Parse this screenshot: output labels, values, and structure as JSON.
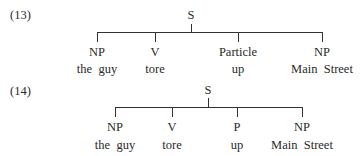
{
  "examples": [
    {
      "number": "(13)",
      "root": "S",
      "children": [
        {
          "label": "NP",
          "words": "the  guy"
        },
        {
          "label": "V",
          "words": "tore"
        },
        {
          "label": "Particle",
          "words": "up"
        },
        {
          "label": "NP",
          "words": "Main  Street"
        }
      ]
    },
    {
      "number": "(14)",
      "root": "S",
      "children": [
        {
          "label": "NP",
          "words": "the  guy"
        },
        {
          "label": "V",
          "words": "tore"
        },
        {
          "label": "P",
          "words": "up"
        },
        {
          "label": "NP",
          "words": "Main  Street"
        }
      ]
    }
  ]
}
